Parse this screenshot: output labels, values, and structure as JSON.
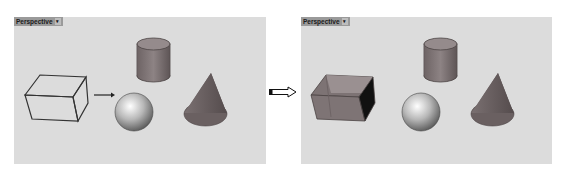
{
  "left_viewport": {
    "label": "Perspective",
    "dropdown_glyph": "▾",
    "objects": [
      "box-wireframe",
      "cylinder",
      "sphere",
      "cone"
    ],
    "box_display": "wireframe"
  },
  "right_viewport": {
    "label": "Perspective",
    "dropdown_glyph": "▾",
    "objects": [
      "box-shaded",
      "cylinder",
      "sphere",
      "cone"
    ],
    "box_display": "shaded"
  },
  "colors": {
    "viewport_bg": "#dcdcdc",
    "solid_fill": "#8a7f80",
    "solid_dark": "#5e5556",
    "edge": "#3a3a3a",
    "label_bg": "#9a9a9a"
  }
}
